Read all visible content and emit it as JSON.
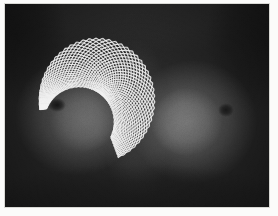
{
  "figure": {
    "title": "",
    "caption": "",
    "kind": "grayscale-photograph-with-vector-field-overlay",
    "plate": {
      "x": 5,
      "y": 4,
      "width": 264,
      "height": 203,
      "border_color": "#d8d8d4",
      "page_color": "#fbfbfa"
    }
  },
  "palette": {
    "page_background": "#fbfbfa",
    "plate_border": "#d8d8d4",
    "photo_darkest": "#171717",
    "photo_background": "#272727",
    "photo_midtone": "#4a4a4a",
    "photo_highlight": "#787878",
    "photo_brightest": "#8e8e8e",
    "nipple_shadow": "#121212",
    "overlay_stroke": "#f2f2f2",
    "overlay_stroke_dim": "#cfcfcf"
  },
  "photo": {
    "shading_regions": [
      {
        "name": "upper-chest-shadow",
        "cx": 132,
        "cy": 6,
        "rx": 150,
        "ry": 44,
        "color": "#2e2e2e"
      },
      {
        "name": "left-shoulder-shadow",
        "cx": 10,
        "cy": 30,
        "rx": 52,
        "ry": 70,
        "color": "#1b1b1b"
      },
      {
        "name": "right-shoulder-shadow",
        "cx": 256,
        "cy": 34,
        "rx": 56,
        "ry": 74,
        "color": "#1c1c1c"
      },
      {
        "name": "sternum-midline",
        "cx": 132,
        "cy": 120,
        "rx": 34,
        "ry": 86,
        "color": "#3a3a3a"
      },
      {
        "name": "left-breast-body",
        "cx": 72,
        "cy": 112,
        "rx": 62,
        "ry": 60,
        "color": "#5c5c5c"
      },
      {
        "name": "left-breast-highlight",
        "cx": 78,
        "cy": 116,
        "rx": 34,
        "ry": 32,
        "color": "#6e6e6e"
      },
      {
        "name": "right-breast-body",
        "cx": 188,
        "cy": 118,
        "rx": 64,
        "ry": 62,
        "color": "#5f5f5f"
      },
      {
        "name": "right-breast-highlight",
        "cx": 182,
        "cy": 118,
        "rx": 36,
        "ry": 34,
        "color": "#787878"
      },
      {
        "name": "left-nipple",
        "cx": 52,
        "cy": 101,
        "rx": 9,
        "ry": 7,
        "color": "#141414"
      },
      {
        "name": "right-nipple",
        "cx": 221,
        "cy": 106,
        "rx": 8,
        "ry": 7,
        "color": "#191919"
      },
      {
        "name": "lower-abdomen-shadow",
        "cx": 132,
        "cy": 200,
        "rx": 160,
        "ry": 40,
        "color": "#1d1d1d"
      }
    ]
  },
  "overlay": {
    "name": "crescent-mesh-overlay",
    "stroke_color": "#f2f2f2",
    "stroke_width": 1.15,
    "segment_length": 6.5,
    "families": 2,
    "family_angles_deg": [
      38,
      -38
    ],
    "region": {
      "shape": "crescent",
      "outer_center_x": 92,
      "outer_center_y": 96,
      "outer_radius_x": 58,
      "outer_radius_y": 62,
      "inner_center_x": 74,
      "inner_center_y": 118,
      "inner_radius_x": 34,
      "inner_radius_y": 36,
      "angle_start_deg": 170,
      "angle_end_deg": 430,
      "bounds": {
        "left": 42,
        "top": 36,
        "right": 138,
        "bottom": 160
      }
    },
    "grid": {
      "radial_steps": 15,
      "angular_steps": 42
    }
  },
  "annotations": {
    "caption_text": "",
    "labels": []
  }
}
